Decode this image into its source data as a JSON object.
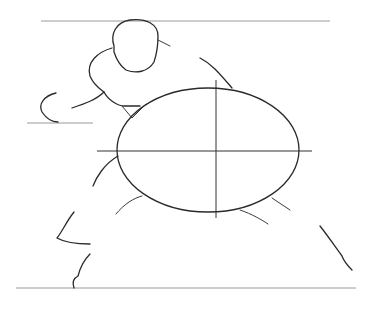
{
  "drawing": {
    "title": "Sketch of crouching figure holding oval shield",
    "colors": {
      "background": "#ffffff",
      "ink": "#2a2a2a",
      "guide": "#9a9a9a"
    }
  }
}
